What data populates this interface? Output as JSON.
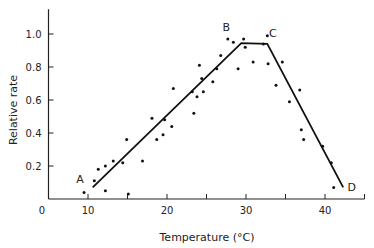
{
  "chart_data": {
    "type": "scatter",
    "title": "",
    "xlabel": "Temperature (°C)",
    "ylabel": "Relative rate",
    "xlim": [
      5,
      45
    ],
    "ylim": [
      0,
      1.15
    ],
    "xticks": [
      10,
      15,
      20,
      25,
      30,
      35,
      40
    ],
    "xtick_labels": {
      "10": "10",
      "20": "20",
      "30": "30",
      "40": "40"
    },
    "yticks": [
      0.2,
      0.4,
      0.6,
      0.8,
      1.0
    ],
    "ytick_labels": [
      "0.2",
      "0.4",
      "0.6",
      "0.8",
      "1.0"
    ],
    "origin_label": "0",
    "grid": false,
    "legend": null,
    "series": [
      {
        "name": "observed",
        "kind": "scatter",
        "points": [
          [
            9.5,
            0.04
          ],
          [
            10.8,
            0.11
          ],
          [
            11.3,
            0.18
          ],
          [
            12.2,
            0.2
          ],
          [
            12.2,
            0.05
          ],
          [
            13.2,
            0.23
          ],
          [
            14.4,
            0.22
          ],
          [
            14.9,
            0.36
          ],
          [
            15.1,
            0.03
          ],
          [
            16.9,
            0.23
          ],
          [
            18.1,
            0.49
          ],
          [
            18.7,
            0.36
          ],
          [
            19.5,
            0.39
          ],
          [
            19.7,
            0.48
          ],
          [
            20.6,
            0.44
          ],
          [
            20.8,
            0.67
          ],
          [
            23.2,
            0.65
          ],
          [
            23.4,
            0.52
          ],
          [
            23.8,
            0.62
          ],
          [
            24.1,
            0.81
          ],
          [
            24.4,
            0.73
          ],
          [
            24.6,
            0.65
          ],
          [
            25.8,
            0.71
          ],
          [
            26.3,
            0.79
          ],
          [
            26.8,
            0.87
          ],
          [
            27.7,
            0.97
          ],
          [
            28.4,
            0.95
          ],
          [
            29.0,
            0.79
          ],
          [
            29.7,
            0.97
          ],
          [
            29.9,
            0.92
          ],
          [
            30.9,
            0.83
          ],
          [
            32.2,
            0.94
          ],
          [
            32.7,
            0.99
          ],
          [
            32.8,
            0.82
          ],
          [
            33.8,
            0.69
          ],
          [
            34.6,
            0.83
          ],
          [
            35.5,
            0.59
          ],
          [
            36.8,
            0.66
          ],
          [
            37.0,
            0.42
          ],
          [
            37.3,
            0.36
          ],
          [
            39.7,
            0.32
          ],
          [
            40.8,
            0.22
          ],
          [
            41.1,
            0.07
          ]
        ]
      },
      {
        "name": "fitted",
        "kind": "line",
        "points": [
          [
            10.6,
            0.07
          ],
          [
            29.4,
            0.945
          ],
          [
            32.7,
            0.94
          ],
          [
            42.3,
            0.07
          ]
        ]
      }
    ],
    "annotations": [
      {
        "text": "A",
        "x": 9.0,
        "y": 0.1
      },
      {
        "text": "B",
        "x": 27.5,
        "y": 1.02
      },
      {
        "text": "C",
        "x": 33.4,
        "y": 0.98
      },
      {
        "text": "D",
        "x": 43.4,
        "y": 0.05
      }
    ]
  }
}
